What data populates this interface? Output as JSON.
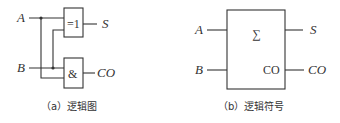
{
  "diagram_a": {
    "caption": "（a）逻辑图",
    "inputs": [
      {
        "label": "A"
      },
      {
        "label": "B"
      }
    ],
    "gates": [
      {
        "name": "xor",
        "label": "=1",
        "output": "S"
      },
      {
        "name": "and",
        "label": "&",
        "output": "CO"
      }
    ]
  },
  "diagram_b": {
    "caption": "（b）逻辑符号",
    "inputs": [
      {
        "label": "A"
      },
      {
        "label": "B"
      }
    ],
    "block_symbol": "∑",
    "block_inner_output": "CO",
    "outputs": [
      {
        "label": "S"
      },
      {
        "label": "CO"
      }
    ]
  },
  "colors": {
    "line": "#333333",
    "background": "#ffffff"
  }
}
